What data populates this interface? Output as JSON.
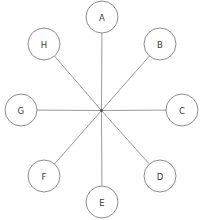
{
  "diagram": {
    "type": "hub-and-spoke",
    "background_color": "#ffffff",
    "node_stroke_color": "#8d8d8d",
    "node_fill_color": "#ffffff",
    "edge_color": "#9a9a9a",
    "label_color": "#3a3a3a",
    "hub": {
      "label": "",
      "x": 101.5,
      "y": 110.5,
      "radius": 1.6
    },
    "node_radius": 16,
    "nodes": [
      {
        "id": "A",
        "label": "A",
        "x": 102,
        "y": 17,
        "angle_deg": 90
      },
      {
        "id": "B",
        "label": "B",
        "x": 160,
        "y": 44,
        "angle_deg": 45
      },
      {
        "id": "C",
        "label": "C",
        "x": 182,
        "y": 110,
        "angle_deg": 0
      },
      {
        "id": "D",
        "label": "D",
        "x": 160,
        "y": 176,
        "angle_deg": -45
      },
      {
        "id": "E",
        "label": "E",
        "x": 102,
        "y": 202,
        "angle_deg": -90
      },
      {
        "id": "F",
        "label": "F",
        "x": 44,
        "y": 176,
        "angle_deg": -135
      },
      {
        "id": "G",
        "label": "G",
        "x": 21,
        "y": 110,
        "angle_deg": 180
      },
      {
        "id": "H",
        "label": "H",
        "x": 44,
        "y": 44,
        "angle_deg": 135
      }
    ],
    "edges": [
      {
        "from": "hub",
        "to": "A"
      },
      {
        "from": "hub",
        "to": "B"
      },
      {
        "from": "hub",
        "to": "C"
      },
      {
        "from": "hub",
        "to": "D"
      },
      {
        "from": "hub",
        "to": "E"
      },
      {
        "from": "hub",
        "to": "F"
      },
      {
        "from": "hub",
        "to": "G"
      },
      {
        "from": "hub",
        "to": "H"
      }
    ]
  }
}
